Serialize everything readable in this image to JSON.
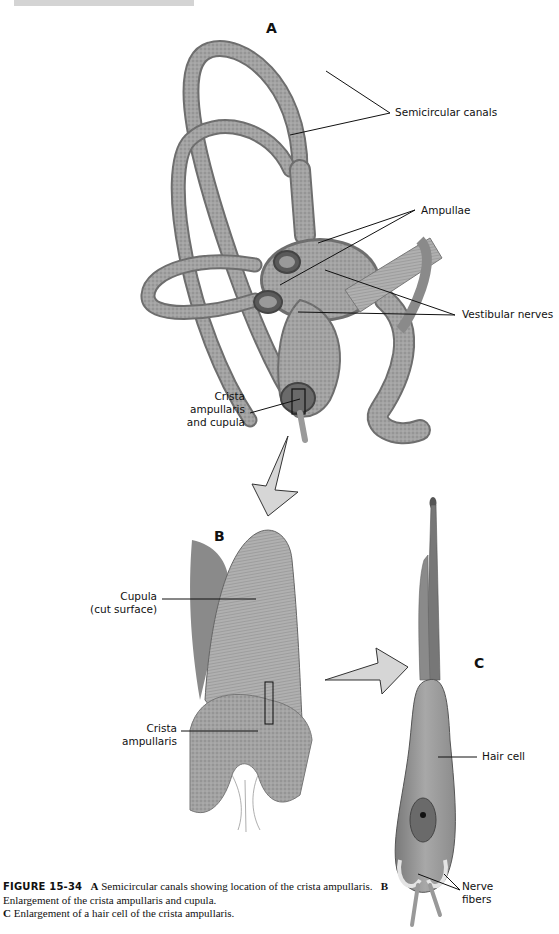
{
  "header": {
    "running_head": ""
  },
  "panels": {
    "A": {
      "letter": "A",
      "labels": {
        "semicircular_canals": "Semicircular canals",
        "ampullae": "Ampullae",
        "vestibular_nerves": "Vestibular nerves",
        "crista_line1": "Crista",
        "crista_line2": "ampullaris",
        "crista_line3": "and cupula"
      }
    },
    "B": {
      "letter": "B",
      "labels": {
        "cupula_line1": "Cupula",
        "cupula_line2": "(cut surface)",
        "crista_line1": "Crista",
        "crista_line2": "ampullaris"
      }
    },
    "C": {
      "letter": "C",
      "labels": {
        "hair_cell": "Hair cell",
        "nerve_line1": "Nerve",
        "nerve_line2": "fibers"
      }
    }
  },
  "caption": {
    "figure_number": "FIGURE 15-34",
    "a_letter": "A",
    "a_text": "Semicircular canals showing location of the crista ampullaris.",
    "b_letter": "B",
    "b_text": "Enlargement of the crista ampullaris and cupula.",
    "c_letter": "C",
    "c_text": "Enlargement of a hair cell of the crista ampullaris."
  },
  "colors": {
    "ink": "#111111",
    "tissue": "#9a9a9a",
    "tissue_dark": "#6e6e6e",
    "tissue_light": "#c4c4c4",
    "arrow_fill": "#d6d6d6"
  }
}
